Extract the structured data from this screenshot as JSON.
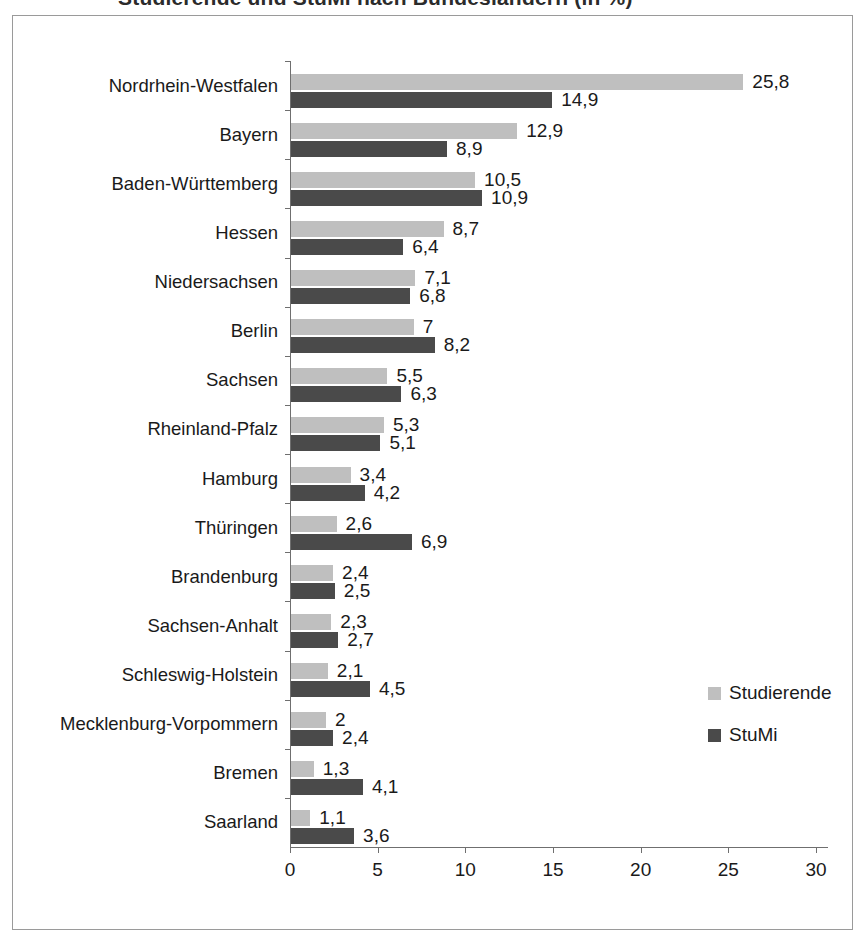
{
  "title_remnant": "Studierende und StuMi nach Bundesländern (in %)",
  "legend": {
    "position": "bottom-right",
    "entries": [
      {
        "label": "Studierende",
        "color": "#bfbfbf",
        "swatch_name": "legend-swatch-studierende"
      },
      {
        "label": "StuMi",
        "color": "#4a4a4a",
        "swatch_name": "legend-swatch-stumi"
      }
    ]
  },
  "chart_data": {
    "type": "bar",
    "orientation": "horizontal",
    "title": "",
    "xlabel": "",
    "ylabel": "",
    "xlim": [
      0,
      30
    ],
    "xticks": [
      "0",
      "5",
      "10",
      "15",
      "20",
      "25",
      "30"
    ],
    "xtick_values": [
      0,
      5,
      10,
      15,
      20,
      25,
      30
    ],
    "grid": false,
    "legend_position": "bottom-right",
    "decimal_separator": ",",
    "categories": [
      "Nordrhein-Westfalen",
      "Bayern",
      "Baden-Württemberg",
      "Hessen",
      "Niedersachsen",
      "Berlin",
      "Sachsen",
      "Rheinland-Pfalz",
      "Hamburg",
      "Thüringen",
      "Brandenburg",
      "Sachsen-Anhalt",
      "Schleswig-Holstein",
      "Mecklenburg-Vorpommern",
      "Bremen",
      "Saarland"
    ],
    "series": [
      {
        "name": "Studierende",
        "color": "#bfbfbf",
        "values": [
          25.8,
          12.9,
          10.5,
          8.7,
          7.1,
          7,
          5.5,
          5.3,
          3.4,
          2.6,
          2.4,
          2.3,
          2.1,
          2,
          1.3,
          1.1
        ],
        "labels": [
          "25,8",
          "12,9",
          "10,5",
          "8,7",
          "7,1",
          "7",
          "5,5",
          "5,3",
          "3,4",
          "2,6",
          "2,4",
          "2,3",
          "2,1",
          "2",
          "1,3",
          "1,1"
        ]
      },
      {
        "name": "StuMi",
        "color": "#4a4a4a",
        "values": [
          14.9,
          8.9,
          10.9,
          6.4,
          6.8,
          8.2,
          6.3,
          5.1,
          4.2,
          6.9,
          2.5,
          2.7,
          4.5,
          2.4,
          4.1,
          3.6
        ],
        "labels": [
          "14,9",
          "8,9",
          "10,9",
          "6,4",
          "6,8",
          "8,2",
          "6,3",
          "5,1",
          "4,2",
          "6,9",
          "2,5",
          "2,7",
          "4,5",
          "2,4",
          "4,1",
          "3,6"
        ]
      }
    ]
  }
}
